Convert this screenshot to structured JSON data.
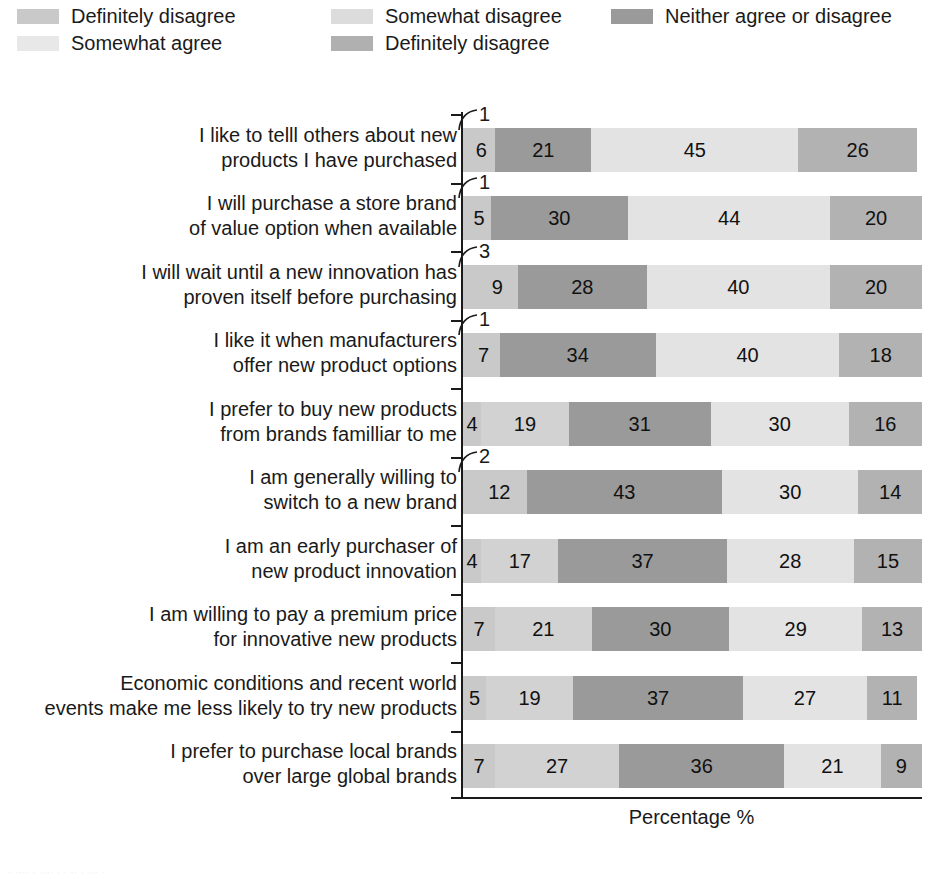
{
  "legend": {
    "items": [
      {
        "label": "Definitely disagree",
        "color": "#c9c9c9",
        "swatch_name": "legend-swatch-definitely-disagree"
      },
      {
        "label": "Somewhat disagree",
        "color": "#dcdcdc",
        "swatch_name": "legend-swatch-somewhat-disagree"
      },
      {
        "label": "Neither agree or disagree",
        "color": "#9a9a9a",
        "swatch_name": "legend-swatch-neither-agree-or-disagree"
      },
      {
        "label": "Somewhat agree",
        "color": "#e8e8e8",
        "swatch_name": "legend-swatch-somewhat-agree"
      },
      {
        "label": "Definitely disagree",
        "color": "#b0b0b0",
        "swatch_name": "legend-swatch-definitely-disagree-2"
      }
    ]
  },
  "axis": {
    "xlabel": "Percentage %"
  },
  "caption": {
    "text": "· ···· · ···· · · ·· · ··· ·"
  },
  "chart_data": {
    "type": "bar",
    "title": "",
    "subtitle": "",
    "xlabel": "Percentage %",
    "ylabel": "",
    "xlim": [
      0,
      100
    ],
    "grid": false,
    "orientation": "horizontal",
    "stacked": true,
    "stack_total": 100,
    "legend_position": "top",
    "series": [
      {
        "name": "Definitely disagree",
        "color": "#c9c9c9",
        "values": [
          1,
          1,
          3,
          1,
          0,
          2,
          0,
          0,
          0,
          0
        ]
      },
      {
        "name": "Somewhat disagree",
        "color": "#dcdcdc",
        "values": [
          6,
          5,
          9,
          7,
          4,
          12,
          4,
          7,
          5,
          7
        ]
      },
      {
        "name": "Neither agree or disagree",
        "color": "#9a9a9a",
        "values": [
          21,
          30,
          28,
          34,
          19,
          43,
          17,
          21,
          19,
          27
        ]
      },
      {
        "name": "Somewhat agree",
        "color": "#e8e8e8",
        "values": [
          45,
          44,
          40,
          40,
          31,
          30,
          37,
          30,
          37,
          36
        ]
      },
      {
        "name": "Definitely disagree",
        "color": "#b0b0b0",
        "values": [
          26,
          20,
          20,
          18,
          30,
          14,
          28,
          29,
          27,
          21
        ]
      }
    ],
    "categories": [
      "I like to telll others about new products I have purchased",
      "I will purchase a store brand of value option when available",
      "I will wait until a new innovation has proven itself before purchasing",
      "I like it when manufacturers offer new product options",
      "I prefer to buy new products from brands familliar to me",
      "I am generally willing to switch to a new brand",
      "I am an early purchaser of new product innovation",
      "I am willing to pay a premium price for innovative new products",
      "Economic conditions and recent world events make me less likely to try new products",
      "I prefer to purchase local brands over large global brands"
    ],
    "rows": [
      {
        "label_line1": "I like to telll others about new",
        "label_line2": "products I have purchased",
        "callout": "1",
        "segments": [
          {
            "series": "Definitely disagree",
            "value": 1,
            "display": "",
            "color": "#c9c9c9"
          },
          {
            "series": "Somewhat disagree",
            "value": 6,
            "display": "6",
            "color": "#c9c9c9"
          },
          {
            "series": "Neither agree or disagree",
            "value": 21,
            "display": "21",
            "color": "#9a9a9a"
          },
          {
            "series": "Somewhat agree",
            "value": 45,
            "display": "45",
            "color": "#e3e3e3"
          },
          {
            "series": "Definitely disagree",
            "value": 26,
            "display": "26",
            "color": "#b2b2b2"
          },
          {
            "series": "Remainder",
            "value": 1,
            "display": "",
            "color": "#ffffff"
          }
        ]
      },
      {
        "label_line1": "I will purchase a store brand",
        "label_line2": "of value option when available",
        "callout": "1",
        "segments": [
          {
            "series": "Definitely disagree",
            "value": 1,
            "display": "",
            "color": "#c9c9c9"
          },
          {
            "series": "Somewhat disagree",
            "value": 5,
            "display": "5",
            "color": "#c9c9c9"
          },
          {
            "series": "Neither agree or disagree",
            "value": 30,
            "display": "30",
            "color": "#9a9a9a"
          },
          {
            "series": "Somewhat agree",
            "value": 44,
            "display": "44",
            "color": "#e3e3e3"
          },
          {
            "series": "Definitely disagree",
            "value": 20,
            "display": "20",
            "color": "#b2b2b2"
          }
        ]
      },
      {
        "label_line1": "I will wait until a new innovation has",
        "label_line2": "proven itself before purchasing",
        "callout": "3",
        "segments": [
          {
            "series": "Definitely disagree",
            "value": 3,
            "display": "",
            "color": "#c9c9c9"
          },
          {
            "series": "Somewhat disagree",
            "value": 9,
            "display": "9",
            "color": "#c9c9c9"
          },
          {
            "series": "Neither agree or disagree",
            "value": 28,
            "display": "28",
            "color": "#9a9a9a"
          },
          {
            "series": "Somewhat agree",
            "value": 40,
            "display": "40",
            "color": "#e3e3e3"
          },
          {
            "series": "Definitely disagree",
            "value": 20,
            "display": "20",
            "color": "#b2b2b2"
          }
        ]
      },
      {
        "label_line1": "I like it when manufacturers",
        "label_line2": "offer new product options",
        "callout": "1",
        "segments": [
          {
            "series": "Definitely disagree",
            "value": 1,
            "display": "",
            "color": "#c9c9c9"
          },
          {
            "series": "Somewhat disagree",
            "value": 7,
            "display": "7",
            "color": "#c9c9c9"
          },
          {
            "series": "Neither agree or disagree",
            "value": 34,
            "display": "34",
            "color": "#9a9a9a"
          },
          {
            "series": "Somewhat agree",
            "value": 40,
            "display": "40",
            "color": "#e3e3e3"
          },
          {
            "series": "Definitely disagree",
            "value": 18,
            "display": "18",
            "color": "#b2b2b2"
          }
        ]
      },
      {
        "label_line1": "I prefer to buy new products",
        "label_line2": "from brands familliar to me",
        "callout": "",
        "segments": [
          {
            "series": "Somewhat disagree",
            "value": 4,
            "display": "4",
            "color": "#c9c9c9"
          },
          {
            "series": "Somewhat disagree",
            "value": 19,
            "display": "19",
            "color": "#d2d2d2"
          },
          {
            "series": "Neither agree or disagree",
            "value": 31,
            "display": "31",
            "color": "#9a9a9a"
          },
          {
            "series": "Somewhat agree",
            "value": 30,
            "display": "30",
            "color": "#e3e3e3"
          },
          {
            "series": "Definitely disagree",
            "value": 16,
            "display": "16",
            "color": "#b2b2b2"
          }
        ]
      },
      {
        "label_line1": "I am generally willing to",
        "label_line2": "switch to a new brand",
        "callout": "2",
        "segments": [
          {
            "series": "Definitely disagree",
            "value": 2,
            "display": "",
            "color": "#c9c9c9"
          },
          {
            "series": "Somewhat disagree",
            "value": 12,
            "display": "12",
            "color": "#c9c9c9"
          },
          {
            "series": "Neither agree or disagree",
            "value": 43,
            "display": "43",
            "color": "#9a9a9a"
          },
          {
            "series": "Somewhat agree",
            "value": 30,
            "display": "30",
            "color": "#e3e3e3"
          },
          {
            "series": "Definitely disagree",
            "value": 14,
            "display": "14",
            "color": "#b2b2b2"
          }
        ]
      },
      {
        "label_line1": "I am an early purchaser of",
        "label_line2": "new product innovation",
        "callout": "",
        "segments": [
          {
            "series": "Somewhat disagree",
            "value": 4,
            "display": "4",
            "color": "#c9c9c9"
          },
          {
            "series": "Somewhat disagree",
            "value": 17,
            "display": "17",
            "color": "#d2d2d2"
          },
          {
            "series": "Neither agree or disagree",
            "value": 37,
            "display": "37",
            "color": "#9a9a9a"
          },
          {
            "series": "Somewhat agree",
            "value": 28,
            "display": "28",
            "color": "#e3e3e3"
          },
          {
            "series": "Definitely disagree",
            "value": 15,
            "display": "15",
            "color": "#b2b2b2"
          }
        ]
      },
      {
        "label_line1": "I am willing to pay a premium price",
        "label_line2": "for innovative new products",
        "callout": "",
        "segments": [
          {
            "series": "Somewhat disagree",
            "value": 7,
            "display": "7",
            "color": "#c9c9c9"
          },
          {
            "series": "Somewhat disagree",
            "value": 21,
            "display": "21",
            "color": "#d2d2d2"
          },
          {
            "series": "Neither agree or disagree",
            "value": 30,
            "display": "30",
            "color": "#9a9a9a"
          },
          {
            "series": "Somewhat agree",
            "value": 29,
            "display": "29",
            "color": "#e3e3e3"
          },
          {
            "series": "Definitely disagree",
            "value": 13,
            "display": "13",
            "color": "#b2b2b2"
          }
        ]
      },
      {
        "label_line1": "Economic conditions and recent world",
        "label_line2": "events make me less likely to try new products",
        "callout": "",
        "segments": [
          {
            "series": "Somewhat disagree",
            "value": 5,
            "display": "5",
            "color": "#c9c9c9"
          },
          {
            "series": "Somewhat disagree",
            "value": 19,
            "display": "19",
            "color": "#d2d2d2"
          },
          {
            "series": "Neither agree or disagree",
            "value": 37,
            "display": "37",
            "color": "#9a9a9a"
          },
          {
            "series": "Somewhat agree",
            "value": 27,
            "display": "27",
            "color": "#e3e3e3"
          },
          {
            "series": "Definitely disagree",
            "value": 11,
            "display": "11",
            "color": "#b2b2b2"
          }
        ]
      },
      {
        "label_line1": "I prefer to purchase local brands",
        "label_line2": "over large global brands",
        "callout": "",
        "segments": [
          {
            "series": "Somewhat disagree",
            "value": 7,
            "display": "7",
            "color": "#c9c9c9"
          },
          {
            "series": "Somewhat disagree",
            "value": 27,
            "display": "27",
            "color": "#d2d2d2"
          },
          {
            "series": "Neither agree or disagree",
            "value": 36,
            "display": "36",
            "color": "#9a9a9a"
          },
          {
            "series": "Somewhat agree",
            "value": 21,
            "display": "21",
            "color": "#e3e3e3"
          },
          {
            "series": "Definitely disagree",
            "value": 9,
            "display": "9",
            "color": "#b2b2b2"
          }
        ]
      }
    ]
  }
}
